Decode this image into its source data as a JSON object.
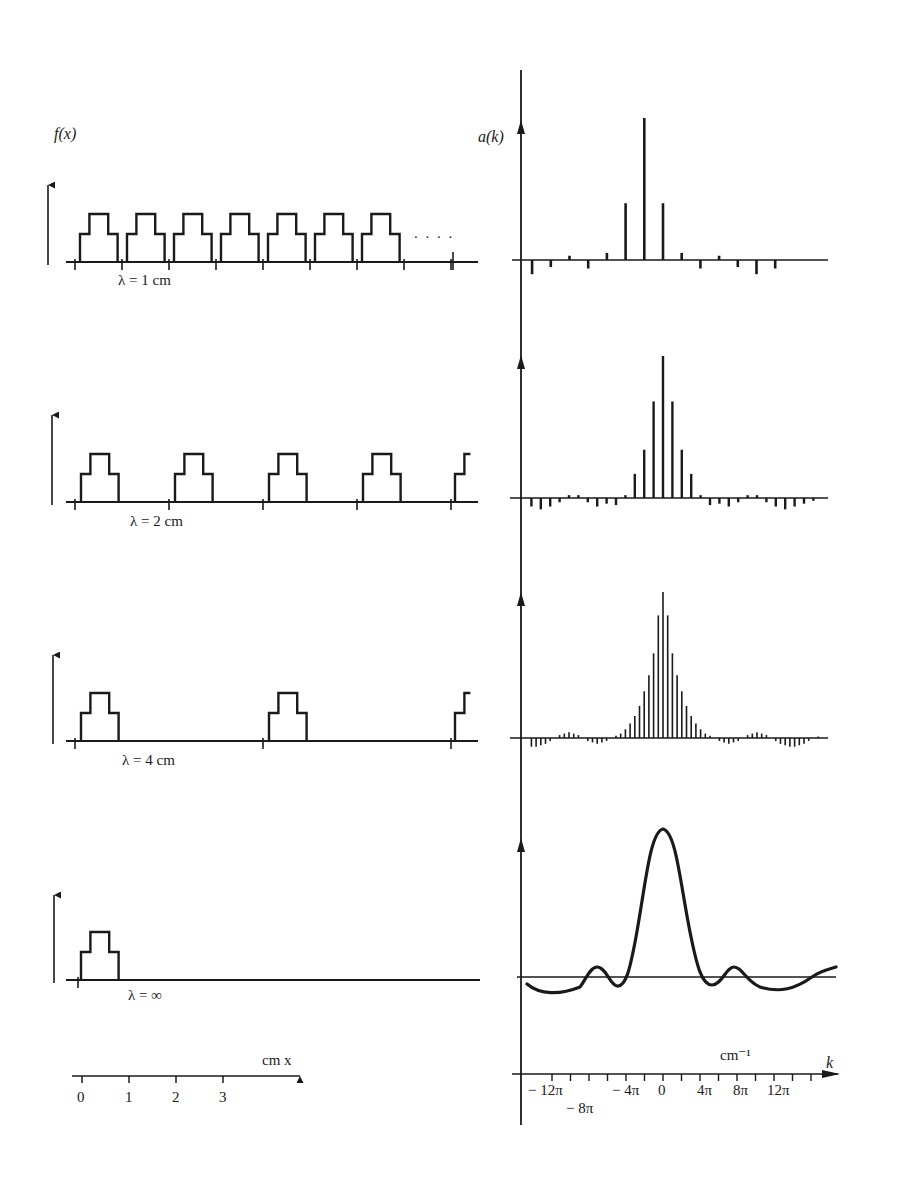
{
  "figure": {
    "ink_color": "#1a1a1a",
    "background": "#ffffff",
    "left_axis_label": "f(x)",
    "right_axis_label": "a(k)",
    "continuation_dots": ". . . .",
    "x_scale": {
      "label": "cm x",
      "ticks": [
        "0",
        "1",
        "2",
        "3"
      ]
    },
    "k_scale": {
      "label_unit": "cm⁻¹",
      "label_var": "k",
      "ticks": [
        "− 12π",
        "− 8π",
        "− 4π",
        "0",
        "4π",
        "8π",
        "12π"
      ]
    },
    "rows": [
      {
        "lambda_label": "λ = 1 cm",
        "period_cm": 1
      },
      {
        "lambda_label": "λ = 2 cm",
        "period_cm": 2
      },
      {
        "lambda_label": "λ = 4 cm",
        "period_cm": 4
      },
      {
        "lambda_label": "λ = ∞",
        "period_cm": null
      }
    ]
  },
  "chart_data": [
    {
      "type": "line",
      "title": "f(x), periodic stepped pulse, λ = 1 cm",
      "xlabel": "x (cm)",
      "ylabel": "f(x)",
      "pulse_profile": {
        "x": [
          0,
          0.1,
          0.3,
          0.6,
          0.8
        ],
        "y": [
          0.5,
          1,
          0.5,
          0
        ],
        "note": "step levels: 0.5 on [0,0.1],1 on [0.1,0.6]... approximated stepped pyramid of width 0.8cm"
      },
      "period_cm": 1,
      "pulses_shown": 7
    },
    {
      "type": "bar",
      "title": "a(k) for λ = 1 cm",
      "xlabel": "k (cm⁻¹)",
      "ylabel": "a(k)",
      "x": [
        -16,
        -14,
        -12,
        -10,
        -8,
        -6,
        -4,
        -2,
        0,
        2,
        4,
        6,
        8,
        10,
        12,
        14,
        16
      ],
      "x_unit": "π",
      "values": [
        -0.06,
        -0.1,
        -0.05,
        0.03,
        -0.06,
        0.05,
        0.4,
        1.0,
        0.4,
        0.05,
        -0.06,
        0.03,
        -0.05,
        -0.1,
        -0.06,
        0,
        0
      ],
      "note": "lines spaced 2π; dominant central peak"
    },
    {
      "type": "line",
      "title": "f(x), λ = 2 cm",
      "period_cm": 2,
      "pulses_shown": 4.5
    },
    {
      "type": "bar",
      "title": "a(k) for λ = 2 cm",
      "xlabel": "k (cm⁻¹)",
      "ylabel": "a(k)",
      "x_spacing": "π",
      "values_center_out": [
        1.0,
        0.68,
        0.34,
        0.17,
        0.02,
        -0.05
      ],
      "note": "lines spaced π; envelope sinc-like"
    },
    {
      "type": "bar",
      "title": "a(k) for λ = 4 cm",
      "xlabel": "k (cm⁻¹)",
      "ylabel": "a(k)",
      "x_spacing": "π/2",
      "values_center_out": [
        1.0,
        0.84,
        0.58,
        0.43,
        0.32,
        0.22,
        0.15,
        0.1,
        0.06,
        0.03
      ],
      "note": "lines spaced π/2; denser sampling of same envelope"
    },
    {
      "type": "line",
      "title": "a(k) for λ = ∞ (continuous transform)",
      "xlabel": "k (cm⁻¹)",
      "ylabel": "a(k)",
      "x_ticks": [
        "-12π",
        "-8π",
        "-4π",
        "0",
        "4π",
        "8π",
        "12π"
      ],
      "peak": {
        "k": 0,
        "value": 1.0
      },
      "side_lobes": [
        {
          "k": "-9π",
          "value": 0.05
        },
        {
          "k": "9π",
          "value": 0.05
        }
      ],
      "minima": [
        {
          "k": "-14π",
          "value": -0.08
        },
        {
          "k": "-6π",
          "value": -0.05
        },
        {
          "k": "6π",
          "value": -0.05
        },
        {
          "k": "13π",
          "value": -0.08
        }
      ]
    }
  ]
}
